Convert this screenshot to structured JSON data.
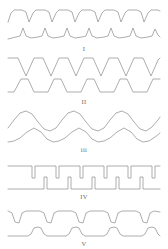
{
  "figure": {
    "background_color": "#ffffff",
    "stroke_color": "#8a8a8a",
    "label_color": "#6b6b6b",
    "panel_count": 5
  },
  "panels": [
    {
      "label": "I",
      "label_text": "I",
      "description": "Flat-topped rounded wave with sharp V notches over a narrow-peaked baseline trace",
      "traces": [
        {
          "name": "upper-trace",
          "shape": "flat-top-notched",
          "cycles": 5,
          "points": "8,22 11,13 14,10 22,10 26,12 29,22 33,13 36,10 45,10 49,12 52,22 56,13 59,10 68,10 72,12 75,22 79,13 82,10 91,10 95,12 98,22 102,13 105,10 114,10 118,12 121,22 125,13 128,10 137,10 141,12 144,22 148,13 151,10 158,10 160,11"
        },
        {
          "name": "lower-trace",
          "shape": "narrow-peaks-on-slope",
          "cycles": 5,
          "points": "8,39 16,37 20,36 23,28 26,36 31,38 38,37 42,36 45,28 48,36 53,38 60,37 64,36 67,28 70,36 75,38 82,37 86,36 89,28 92,36 97,38 104,37 108,36 111,28 114,36 119,38 126,37 130,36 133,28 136,36 141,38 148,37 152,36 155,29 158,35 160,37"
        }
      ]
    },
    {
      "label": "II",
      "label_text": "II",
      "description": "Trapezoidal down-going wave over an upward triangular wave",
      "traces": [
        {
          "name": "upper-trace",
          "shape": "trapezoid-notched",
          "cycles": 6,
          "points": "8,58 18,58 26,76 34,58 43,58 51,76 59,58 68,58 76,76 84,58 93,58 101,76 109,58 118,58 126,76 134,58 143,58 151,76 158,60 160,58"
        },
        {
          "name": "lower-trace",
          "shape": "triangular-up",
          "cycles": 6,
          "points": "8,92 14,92 21,79 28,79 34,92 48,92 54,79 61,79 67,92 81,92 87,79 94,79 100,92 114,92 120,79 127,79 133,92 147,92 153,79 160,79"
        }
      ]
    },
    {
      "label": "III",
      "label_text": "iii",
      "description": "Smooth sinusoidal wave over a second sinusoid of rounded positive humps",
      "traces": [
        {
          "name": "upper-trace",
          "shape": "sinusoid",
          "cycles": 4,
          "points": "8,128 14,120 20,113 26,111 32,114 38,122 44,129 50,131 56,128 62,120 68,113 74,111 80,114 86,122 92,129 98,131 104,128 110,120 116,113 122,111 128,114 134,122 140,129 146,131 152,127 158,120 160,117"
        },
        {
          "name": "lower-trace",
          "shape": "rounded-humps",
          "cycles": 4,
          "points": "8,142 14,141 20,138 27,132 34,128 41,132 47,139 53,142 59,141 65,138 72,132 79,128 86,132 92,139 98,142 104,141 110,138 117,132 124,128 131,132 137,139 143,142 149,141 155,137 160,133"
        }
      ]
    },
    {
      "label": "IV",
      "label_text": "IV",
      "description": "Flat line with narrow downward rectangular notches over a flat line with narrow upward spikes",
      "traces": [
        {
          "name": "upper-trace",
          "shape": "square-notch-down",
          "cycles": 6,
          "points": "8,166 32,166 32,178 35,178 35,166 56,166 56,178 59,178 59,166 80,166 80,178 83,178 83,166 104,166 104,178 107,178 107,166 128,166 128,178 131,178 131,166 152,166 152,178 155,178 155,166 160,166"
        },
        {
          "name": "lower-trace",
          "shape": "square-spike-up",
          "cycles": 5,
          "points": "8,189 44,189 44,177 47,177 47,189 68,189 68,177 71,177 71,189 92,189 92,177 95,177 95,189 116,189 116,177 119,177 119,189 140,189 140,177 143,177 143,189 160,189"
        }
      ]
    },
    {
      "label": "V",
      "label_text": "V",
      "description": "Rounded square wave with smooth downward troughs over a flat line with rounded upward bumps",
      "traces": [
        {
          "name": "upper-trace",
          "shape": "rounded-square-down",
          "cycles": 5,
          "points": "8,211 12,213 15,222 19,223 22,213 26,211 40,211 44,213 47,222 51,223 54,213 58,211 72,211 76,213 79,222 83,223 86,213 90,211 104,211 108,213 111,222 115,223 118,213 122,211 136,211 140,213 143,222 147,223 150,213 154,211 160,212"
        },
        {
          "name": "lower-trace",
          "shape": "rounded-bumps-up",
          "cycles": 4,
          "points": "8,236 28,236 31,234 34,228 38,227 41,228 44,234 47,236 66,236 69,234 72,228 76,227 79,228 82,234 85,236 104,236 107,234 110,228 114,227 117,228 120,234 123,236 142,236 145,234 148,228 152,227 155,228 158,234 160,236"
        }
      ]
    }
  ]
}
